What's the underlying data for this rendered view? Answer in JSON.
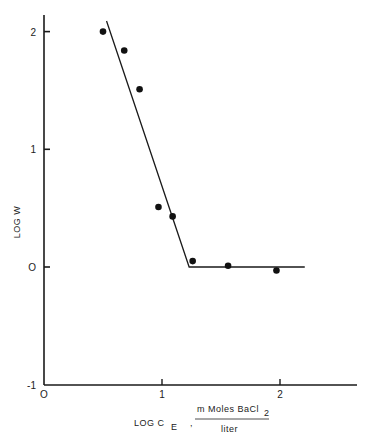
{
  "chart_data": {
    "type": "scatter",
    "title": "",
    "xlabel": "LOG C_E , mMoles BaCl2 / liter",
    "xlabel_parts": {
      "main": "LOG C",
      "subscript": "E",
      "separator": ",",
      "fraction_numerator": "m Moles  BaCl",
      "fraction_numerator_subscript": "2",
      "fraction_denominator": "liter"
    },
    "ylabel": "LOG W",
    "xlim": [
      0,
      2.7
    ],
    "ylim": [
      -1,
      2.15
    ],
    "x_ticks": [
      0,
      1,
      2
    ],
    "x_tick_labels": [
      "O",
      "1",
      "2"
    ],
    "y_ticks": [
      -1,
      0,
      1,
      2
    ],
    "y_tick_labels": [
      "-1",
      "O",
      "1",
      "2"
    ],
    "grid": false,
    "legend": null,
    "series": [
      {
        "name": "data points",
        "marker": "filled-circle",
        "x": [
          0.5,
          0.68,
          0.81,
          0.97,
          1.09,
          1.26,
          1.56,
          1.97
        ],
        "y": [
          2.0,
          1.84,
          1.51,
          0.51,
          0.43,
          0.05,
          0.01,
          -0.03
        ]
      },
      {
        "name": "fitted line",
        "type": "line",
        "x": [
          0.53,
          1.23,
          2.21
        ],
        "y": [
          2.09,
          0.0,
          0.0
        ]
      }
    ]
  }
}
